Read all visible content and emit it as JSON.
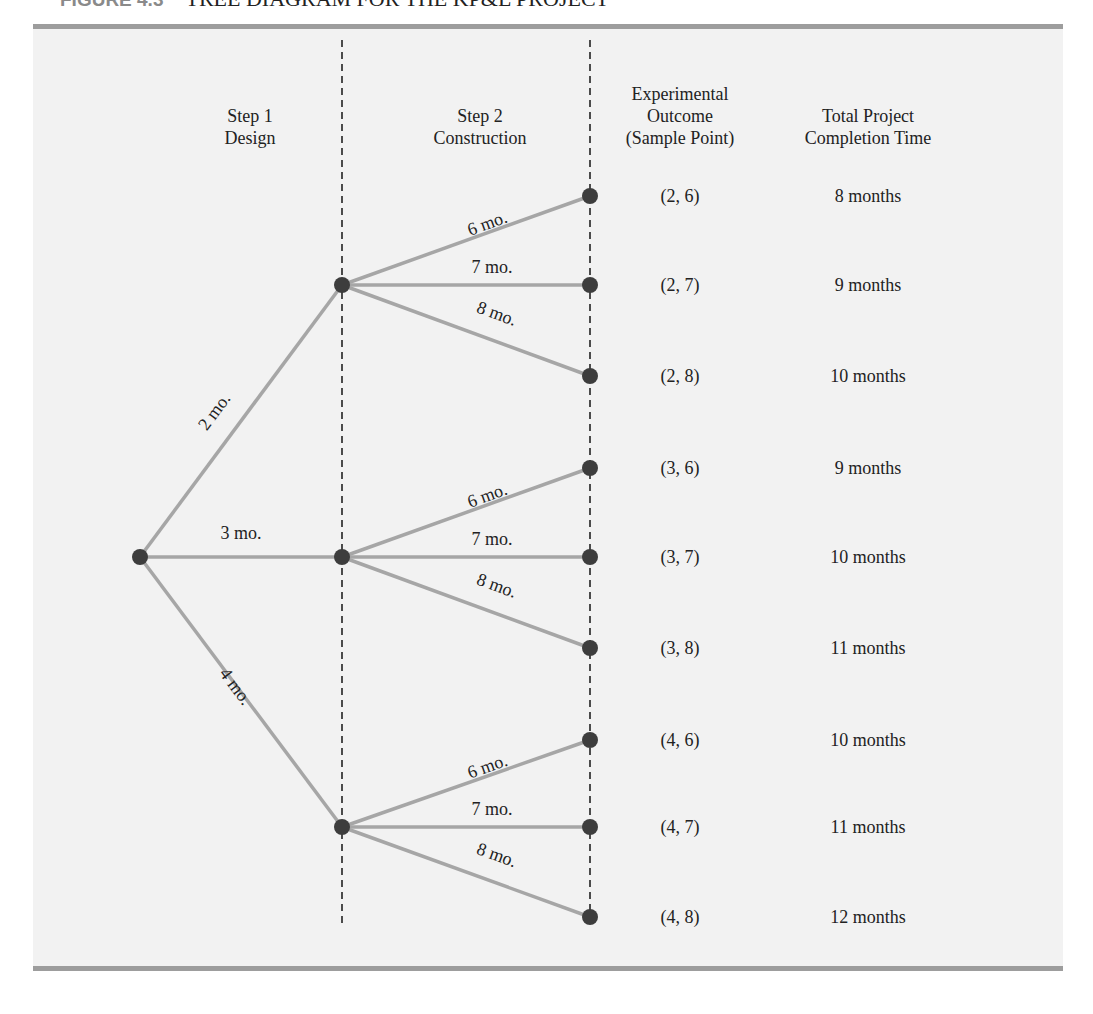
{
  "figure": {
    "label": "FIGURE 4.3",
    "title": "TREE DIAGRAM FOR THE KP&L PROJECT"
  },
  "headers": {
    "step1": [
      "Step 1",
      "Design"
    ],
    "step2": [
      "Step 2",
      "Construction"
    ],
    "outcome": [
      "Experimental",
      "Outcome",
      "(Sample Point)"
    ],
    "total": [
      "Total Project",
      "Completion Time"
    ]
  },
  "colors": {
    "panel_bg": "#f2f2f2",
    "rule": "#9d9d9d",
    "branch": "#a6a6a6",
    "node": "#3d3d3d",
    "dashed": "#222222"
  },
  "tree": {
    "root": {
      "x": 140,
      "y": 557
    },
    "step1": [
      {
        "label": "2 mo.",
        "design": 2,
        "x": 342,
        "y": 285
      },
      {
        "label": "3 mo.",
        "design": 3,
        "x": 342,
        "y": 557
      },
      {
        "label": "4 mo.",
        "design": 4,
        "x": 342,
        "y": 827
      }
    ],
    "step2_labels": [
      "6 mo.",
      "7 mo.",
      "8 mo."
    ],
    "leaves": [
      {
        "parent": 0,
        "construction": 6,
        "x": 590,
        "y": 196,
        "sample_point": "(2, 6)",
        "total": "8 months"
      },
      {
        "parent": 0,
        "construction": 7,
        "x": 590,
        "y": 285,
        "sample_point": "(2, 7)",
        "total": "9 months"
      },
      {
        "parent": 0,
        "construction": 8,
        "x": 590,
        "y": 376,
        "sample_point": "(2, 8)",
        "total": "10 months"
      },
      {
        "parent": 1,
        "construction": 6,
        "x": 590,
        "y": 468,
        "sample_point": "(3, 6)",
        "total": "9 months"
      },
      {
        "parent": 1,
        "construction": 7,
        "x": 590,
        "y": 557,
        "sample_point": "(3, 7)",
        "total": "10 months"
      },
      {
        "parent": 1,
        "construction": 8,
        "x": 590,
        "y": 648,
        "sample_point": "(3, 8)",
        "total": "11 months"
      },
      {
        "parent": 2,
        "construction": 6,
        "x": 590,
        "y": 740,
        "sample_point": "(4, 6)",
        "total": "10 months"
      },
      {
        "parent": 2,
        "construction": 7,
        "x": 590,
        "y": 827,
        "sample_point": "(4, 7)",
        "total": "11 months"
      },
      {
        "parent": 2,
        "construction": 8,
        "x": 590,
        "y": 917,
        "sample_point": "(4, 8)",
        "total": "12 months"
      }
    ]
  }
}
